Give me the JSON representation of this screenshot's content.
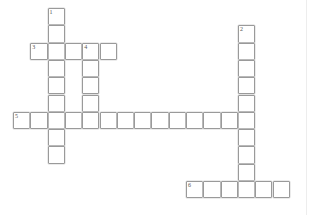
{
  "puzzle": {
    "kind": "crossword-grid",
    "title": "",
    "background_color": "#ffffff",
    "cell_border_color": "#9a9a9a",
    "cell_fill_color": "#ffffff",
    "number_color": "#555555",
    "cell_size_px": 17.3,
    "origin": {
      "x": 13,
      "y": 8
    },
    "rows": 12,
    "cols": 16,
    "entries": [
      {
        "number": "1",
        "direction": "down",
        "row": 0,
        "col": 2,
        "length": 9
      },
      {
        "number": "2",
        "direction": "down",
        "row": 1,
        "col": 13,
        "length": 10
      },
      {
        "number": "3",
        "direction": "across",
        "row": 2,
        "col": 1,
        "length": 5
      },
      {
        "number": "4",
        "direction": "down",
        "row": 2,
        "col": 4,
        "length": 5
      },
      {
        "number": "5",
        "direction": "across",
        "row": 6,
        "col": 0,
        "length": 15
      },
      {
        "number": "6",
        "direction": "across",
        "row": 10,
        "col": 10,
        "length": 6
      }
    ],
    "cells": [
      {
        "row": 0,
        "col": 2,
        "number": "1"
      },
      {
        "row": 1,
        "col": 2,
        "number": ""
      },
      {
        "row": 2,
        "col": 2,
        "number": ""
      },
      {
        "row": 3,
        "col": 2,
        "number": ""
      },
      {
        "row": 4,
        "col": 2,
        "number": ""
      },
      {
        "row": 5,
        "col": 2,
        "number": ""
      },
      {
        "row": 6,
        "col": 2,
        "number": ""
      },
      {
        "row": 7,
        "col": 2,
        "number": ""
      },
      {
        "row": 8,
        "col": 2,
        "number": ""
      },
      {
        "row": 1,
        "col": 13,
        "number": "2"
      },
      {
        "row": 2,
        "col": 13,
        "number": ""
      },
      {
        "row": 3,
        "col": 13,
        "number": ""
      },
      {
        "row": 4,
        "col": 13,
        "number": ""
      },
      {
        "row": 5,
        "col": 13,
        "number": ""
      },
      {
        "row": 6,
        "col": 13,
        "number": ""
      },
      {
        "row": 7,
        "col": 13,
        "number": ""
      },
      {
        "row": 8,
        "col": 13,
        "number": ""
      },
      {
        "row": 9,
        "col": 13,
        "number": ""
      },
      {
        "row": 10,
        "col": 13,
        "number": ""
      },
      {
        "row": 2,
        "col": 1,
        "number": "3"
      },
      {
        "row": 2,
        "col": 3,
        "number": ""
      },
      {
        "row": 2,
        "col": 4,
        "number": "4"
      },
      {
        "row": 2,
        "col": 5,
        "number": ""
      },
      {
        "row": 3,
        "col": 4,
        "number": ""
      },
      {
        "row": 4,
        "col": 4,
        "number": ""
      },
      {
        "row": 5,
        "col": 4,
        "number": ""
      },
      {
        "row": 6,
        "col": 0,
        "number": "5"
      },
      {
        "row": 6,
        "col": 1,
        "number": ""
      },
      {
        "row": 6,
        "col": 3,
        "number": ""
      },
      {
        "row": 6,
        "col": 4,
        "number": ""
      },
      {
        "row": 6,
        "col": 5,
        "number": ""
      },
      {
        "row": 6,
        "col": 6,
        "number": ""
      },
      {
        "row": 6,
        "col": 7,
        "number": ""
      },
      {
        "row": 6,
        "col": 8,
        "number": ""
      },
      {
        "row": 6,
        "col": 9,
        "number": ""
      },
      {
        "row": 6,
        "col": 10,
        "number": ""
      },
      {
        "row": 6,
        "col": 11,
        "number": ""
      },
      {
        "row": 6,
        "col": 12,
        "number": ""
      },
      {
        "row": 10,
        "col": 10,
        "number": "6"
      },
      {
        "row": 10,
        "col": 11,
        "number": ""
      },
      {
        "row": 10,
        "col": 12,
        "number": ""
      },
      {
        "row": 10,
        "col": 14,
        "number": ""
      },
      {
        "row": 10,
        "col": 15,
        "number": ""
      }
    ]
  }
}
